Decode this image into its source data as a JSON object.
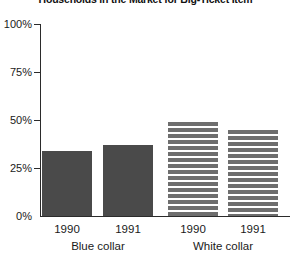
{
  "chart_data": {
    "type": "bar",
    "title": "Households in the Market for Big-Ticket Item",
    "xlabel": "",
    "ylabel": "",
    "ylim": [
      0,
      100
    ],
    "ytick_labels": [
      "100%",
      "75%",
      "50%",
      "25%",
      "0%"
    ],
    "ytick_values": [
      100,
      75,
      50,
      25,
      0
    ],
    "grid": false,
    "legend": "none",
    "categories": [
      "1990",
      "1991",
      "1990",
      "1991"
    ],
    "groups": [
      {
        "name": "Blue collar",
        "fill": "solid",
        "color": "#4a4a4a",
        "points": [
          {
            "category": "1990",
            "value": 34
          },
          {
            "category": "1991",
            "value": 37
          }
        ]
      },
      {
        "name": "White collar",
        "fill": "horizontal-stripes",
        "color": "#6e6e6e",
        "points": [
          {
            "category": "1990",
            "value": 49
          },
          {
            "category": "1991",
            "value": 45
          }
        ]
      }
    ],
    "values": [
      34,
      37,
      49,
      45
    ]
  },
  "axis": {
    "y": {
      "t100": "100%",
      "t75": "75%",
      "t50": "50%",
      "t25": "25%",
      "t0": "0%"
    },
    "x": {
      "bar1_year": "1990",
      "bar2_year": "1991",
      "bar3_year": "1990",
      "bar4_year": "1991",
      "group1": "Blue collar",
      "group2": "White collar"
    }
  },
  "title": "Households in the Market for Big-Ticket Item"
}
